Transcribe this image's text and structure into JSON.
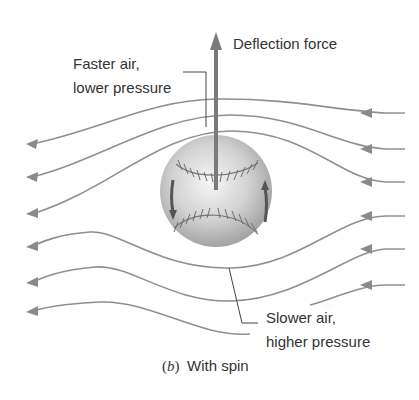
{
  "figure": {
    "caption_letter": "b",
    "caption_paren_open": "(",
    "caption_paren_close": ")",
    "caption_text": "With spin",
    "labels": {
      "deflection": "Deflection force",
      "faster_line1": "Faster air,",
      "faster_line2": "lower pressure",
      "slower_line1": "Slower air,",
      "slower_line2": "higher pressure"
    },
    "colors": {
      "streamline": "#8f8f8f",
      "arrow": "#7a7a7a",
      "text": "#333333",
      "ball_light": "#f4f4f4",
      "ball_dark": "#9a9a9a",
      "stitch": "#6d6d6d",
      "spin_arrow": "#555555"
    },
    "streamlines_count": 6,
    "flow_direction": "right-to-left"
  }
}
